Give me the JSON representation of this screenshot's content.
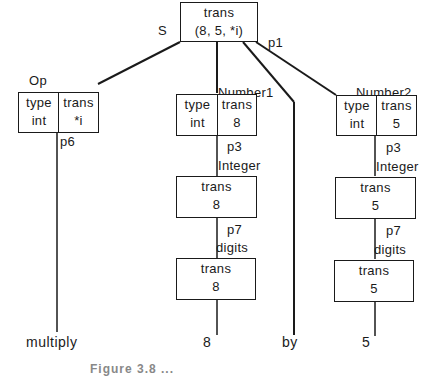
{
  "diagram": {
    "root": {
      "label": "S",
      "attr": "trans",
      "value": "(8,  5,  *i)"
    },
    "productions": {
      "root": "p1",
      "op": "p6",
      "number1": "p3",
      "integer1": "p7",
      "number2": "p3",
      "integer2": "p7"
    },
    "op": {
      "label": "Op",
      "left_attr": "type",
      "left_value": "int",
      "right_attr": "trans",
      "right_value": "*i"
    },
    "number1": {
      "label": "Number1",
      "left_attr": "type",
      "left_value": "int",
      "right_attr": "trans",
      "right_value": "8"
    },
    "integer1": {
      "label": "Integer",
      "attr": "trans",
      "value": "8"
    },
    "digits1": {
      "label": "digits",
      "attr": "trans",
      "value": "8"
    },
    "number2": {
      "label": "Number2",
      "left_attr": "type",
      "left_value": "int",
      "right_attr": "trans",
      "right_value": "5"
    },
    "integer2": {
      "label": "Integer",
      "attr": "trans",
      "value": "5"
    },
    "digits2": {
      "label": "digits",
      "attr": "trans",
      "value": "5"
    },
    "leaves": [
      "multiply",
      "8",
      "by",
      "5"
    ],
    "caption": "Figure 3.8  ..."
  }
}
